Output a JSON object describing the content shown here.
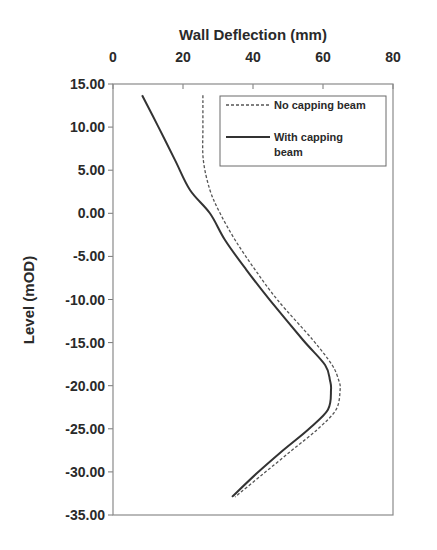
{
  "chart_data": {
    "type": "line",
    "title": "",
    "xlabel": "Wall Deflection (mm)",
    "ylabel": "Level (mOD)",
    "xlim": [
      0,
      80
    ],
    "ylim": [
      -35,
      15
    ],
    "x_axis_position": "top",
    "x_ticks": [
      0,
      20,
      40,
      60,
      80
    ],
    "x_tick_labels": [
      "0",
      "20",
      "40",
      "60",
      "80"
    ],
    "y_ticks": [
      15,
      10,
      5,
      0,
      -5,
      -10,
      -15,
      -20,
      -25,
      -30,
      -35
    ],
    "y_tick_labels": [
      "15.00",
      "10.00",
      "5.00",
      "0.00",
      "-5.00",
      "-10.00",
      "-15.00",
      "-20.00",
      "-25.00",
      "-30.00",
      "-35.00"
    ],
    "grid": false,
    "legend_position": "top-right",
    "series": [
      {
        "name": "No capping beam",
        "style": "dashed",
        "color": "#555555",
        "points": [
          [
            25.7,
            13.7
          ],
          [
            25.7,
            10.0
          ],
          [
            25.8,
            6.2
          ],
          [
            27.7,
            2.7
          ],
          [
            30.6,
            0.0
          ],
          [
            34.9,
            -3.1
          ],
          [
            40.5,
            -6.5
          ],
          [
            47.1,
            -10.1
          ],
          [
            57.1,
            -14.7
          ],
          [
            62.6,
            -17.6
          ],
          [
            64.5,
            -19.4
          ],
          [
            64.9,
            -20.5
          ],
          [
            63.7,
            -22.8
          ],
          [
            58.3,
            -25.1
          ],
          [
            51.1,
            -27.5
          ],
          [
            43.0,
            -30.2
          ],
          [
            34.9,
            -32.9
          ]
        ]
      },
      {
        "name": "With capping beam",
        "style": "solid",
        "color": "#333333",
        "points": [
          [
            8.3,
            13.7
          ],
          [
            13.0,
            10.0
          ],
          [
            17.7,
            6.2
          ],
          [
            22.0,
            2.7
          ],
          [
            27.7,
            0.0
          ],
          [
            32.0,
            -3.1
          ],
          [
            38.0,
            -6.5
          ],
          [
            44.9,
            -10.1
          ],
          [
            54.3,
            -14.7
          ],
          [
            60.6,
            -17.6
          ],
          [
            62.0,
            -19.4
          ],
          [
            62.3,
            -20.5
          ],
          [
            61.4,
            -22.8
          ],
          [
            55.7,
            -25.1
          ],
          [
            48.6,
            -27.5
          ],
          [
            41.0,
            -30.2
          ],
          [
            34.0,
            -32.9
          ]
        ]
      }
    ]
  },
  "legend": {
    "items": [
      {
        "label_line1": "No capping beam",
        "label_line2": ""
      },
      {
        "label_line1": "With capping",
        "label_line2": "beam"
      }
    ]
  }
}
